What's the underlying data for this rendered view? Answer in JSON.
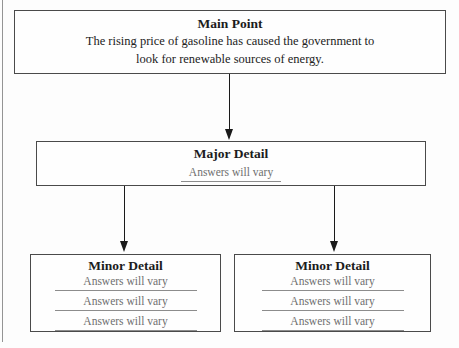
{
  "diagram": {
    "type": "graphic-organizer-flowchart",
    "main_point": {
      "title": "Main Point",
      "line1": "The rising price of gasoline has caused the government to",
      "line2": "look for renewable sources of energy."
    },
    "major_detail": {
      "title": "Major Detail",
      "answer": "Answers will vary"
    },
    "minor_details": [
      {
        "title": "Minor Detail",
        "answers": [
          "Answers will vary",
          "Answers will vary",
          "Answers will vary"
        ]
      },
      {
        "title": "Minor Detail",
        "answers": [
          "Answers will vary",
          "Answers will vary",
          "Answers will vary"
        ]
      }
    ]
  },
  "colors": {
    "background": "#fdfdfd",
    "box_background": "#fefefe",
    "box_border": "#4a4a4a",
    "heading_text": "#1c1c1c",
    "body_text": "#222222",
    "answer_text": "#6f6f6f",
    "underline": "#8c8c8c",
    "arrow": "#1a1a1a",
    "page_edge": "#949494"
  }
}
